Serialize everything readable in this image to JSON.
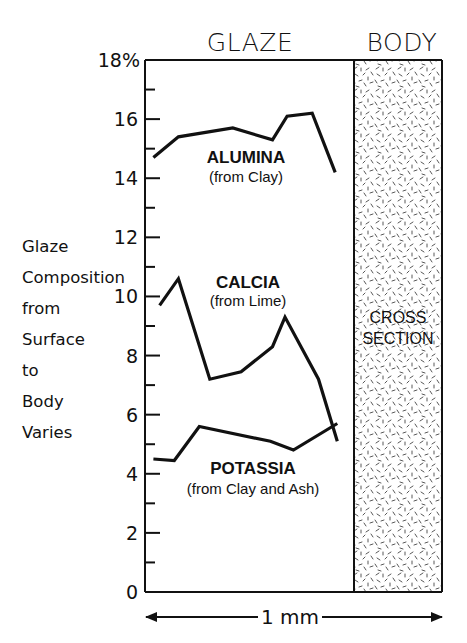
{
  "chart_data": {
    "type": "line",
    "title": "",
    "regions": [
      {
        "name": "GLAZE",
        "label": "GLAZE"
      },
      {
        "name": "BODY",
        "label": "BODY",
        "annotation": [
          "CROSS",
          "SECTION"
        ]
      }
    ],
    "xlabel": "1 mm",
    "ylabel_lines": [
      "Glaze",
      "Composition",
      "from",
      "Surface",
      "to",
      "Body",
      "Varies"
    ],
    "ylim": [
      0,
      18
    ],
    "y_ticks_major": [
      0,
      2,
      4,
      6,
      8,
      10,
      12,
      14,
      16,
      18
    ],
    "y_tick_labels": [
      "0",
      "2",
      "4",
      "6",
      "8",
      "10",
      "12",
      "14",
      "16",
      "18%"
    ],
    "y_ticks_minor": [
      1,
      3,
      5,
      7,
      9,
      11,
      13,
      15,
      17
    ],
    "grid": false,
    "x_unit": "relative position across glaze (0 = surface, 1 = body boundary)",
    "series": [
      {
        "name": "ALUMINA",
        "subtitle": "(from Clay)",
        "x": [
          0.04,
          0.16,
          0.42,
          0.61,
          0.68,
          0.8,
          0.91
        ],
        "values": [
          14.7,
          15.4,
          15.7,
          15.3,
          16.1,
          16.2,
          14.2
        ]
      },
      {
        "name": "CALCIA",
        "subtitle": "(from Lime)",
        "x": [
          0.07,
          0.16,
          0.31,
          0.46,
          0.61,
          0.67,
          0.83,
          0.92
        ],
        "values": [
          9.7,
          10.6,
          7.2,
          7.45,
          8.3,
          9.3,
          7.2,
          5.1
        ]
      },
      {
        "name": "POTASSIA",
        "subtitle": "(from Clay and Ash)",
        "x": [
          0.04,
          0.14,
          0.26,
          0.6,
          0.71,
          0.92
        ],
        "values": [
          4.5,
          4.45,
          5.6,
          5.1,
          4.8,
          5.7
        ]
      }
    ]
  }
}
